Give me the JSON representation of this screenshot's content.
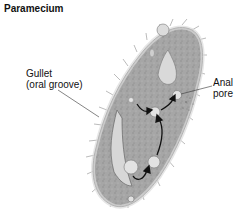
{
  "title": "Paramecium",
  "labels": {
    "gullet_line1": "Gullet",
    "gullet_line2": "(oral groove)",
    "anal_line1": "Anal",
    "anal_line2": "pore"
  },
  "colors": {
    "body_fill": "#a9a9a9",
    "body_edge": "#d9d9d9",
    "outline": "#555555",
    "arrow": "#111111"
  }
}
